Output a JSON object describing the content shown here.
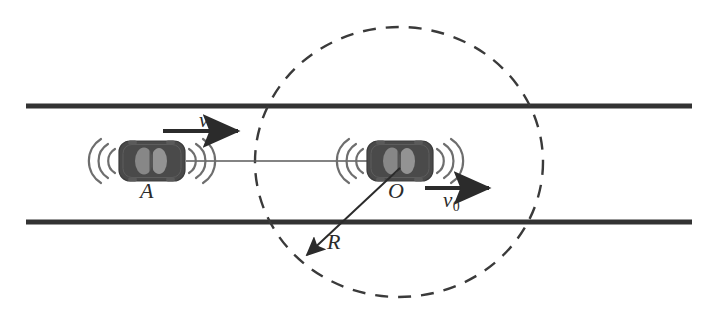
{
  "figure": {
    "background_color": "#ffffff",
    "width": 714,
    "height": 315
  },
  "colors": {
    "road_line": "#333333",
    "car_body": "#4a4a4a",
    "car_window": "#8c8c8c",
    "wave_arc": "#666666",
    "dashed_circle": "#3a3a3a",
    "connector_line": "#5a5a5a",
    "arrow": "#2b2b2b",
    "label_text": "#2b2b2b"
  },
  "road": {
    "name": "straight-two-lane-road",
    "upper_line": {
      "x1": 26,
      "y1": 106,
      "x2": 692,
      "y2": 106
    },
    "lower_line": {
      "x1": 26,
      "y1": 222,
      "x2": 692,
      "y2": 222
    },
    "line_width": 5
  },
  "circle": {
    "name": "detection-range-circle",
    "style": "dashed",
    "center_x": 399,
    "center_y": 162,
    "radius_x": 144,
    "radius_y": 135,
    "dash_pattern": "13 10",
    "stroke_width": 2.4
  },
  "cars": [
    {
      "id": "car-a",
      "label": "A",
      "center_x": 152,
      "center_y": 161,
      "body_width": 66,
      "body_height": 40,
      "emits_waves": true,
      "wave_sides": [
        "left",
        "right"
      ]
    },
    {
      "id": "car-o",
      "label": "O",
      "center_x": 400,
      "center_y": 161,
      "body_width": 66,
      "body_height": 40,
      "emits_waves": true,
      "wave_sides": [
        "left",
        "right"
      ]
    }
  ],
  "connector": {
    "name": "line-of-sight-between-cars",
    "x1": 190,
    "y1": 161,
    "x2": 370,
    "y2": 161,
    "stroke_width": 1.3
  },
  "vectors": [
    {
      "id": "velocity-v",
      "label": "v",
      "subscript": "",
      "description": "velocity of car A",
      "x1": 163,
      "y1": 131,
      "x2": 243,
      "y2": 131,
      "direction": "right",
      "label_position": "above"
    },
    {
      "id": "velocity-v0",
      "label": "v",
      "subscript": "0",
      "description": "velocity of car O",
      "x1": 425,
      "y1": 188,
      "x2": 494,
      "y2": 188,
      "direction": "right",
      "label_position": "below"
    },
    {
      "id": "radius-r",
      "label": "R",
      "subscript": "",
      "description": "radius of the detection circle, drawn from O down-left to the circle",
      "x1": 400,
      "y1": 168,
      "x2": 303,
      "y2": 259,
      "direction": "down-left",
      "label_position": "right"
    }
  ]
}
